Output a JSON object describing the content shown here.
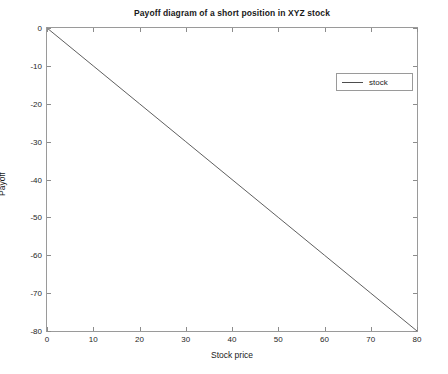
{
  "chart_data": {
    "type": "line",
    "title": "Payoff diagram of a short position in XYZ stock",
    "xlabel": "Stock price",
    "ylabel": "Payoff",
    "xlim": [
      0,
      80
    ],
    "ylim": [
      -80,
      0
    ],
    "grid": false,
    "legend_position": "upper right",
    "xticks": [
      0,
      10,
      20,
      30,
      40,
      50,
      60,
      70,
      80
    ],
    "xtick_labels": [
      "0",
      "10",
      "20",
      "30",
      "40",
      "50",
      "60",
      "70",
      "80"
    ],
    "yticks": [
      0,
      -10,
      -20,
      -30,
      -40,
      -50,
      -60,
      -70,
      -80
    ],
    "ytick_labels": [
      "0",
      "-10",
      "-20",
      "-30",
      "-40",
      "-50",
      "-60",
      "-70",
      "-80"
    ],
    "series": [
      {
        "name": "stock",
        "color": "#4d4d4d",
        "x": [
          0,
          10,
          20,
          30,
          40,
          50,
          60,
          70,
          80
        ],
        "values": [
          0,
          -10,
          -20,
          -30,
          -40,
          -50,
          -60,
          -70,
          -80
        ]
      }
    ]
  },
  "legend": {
    "entries": [
      {
        "label": "stock"
      }
    ]
  }
}
